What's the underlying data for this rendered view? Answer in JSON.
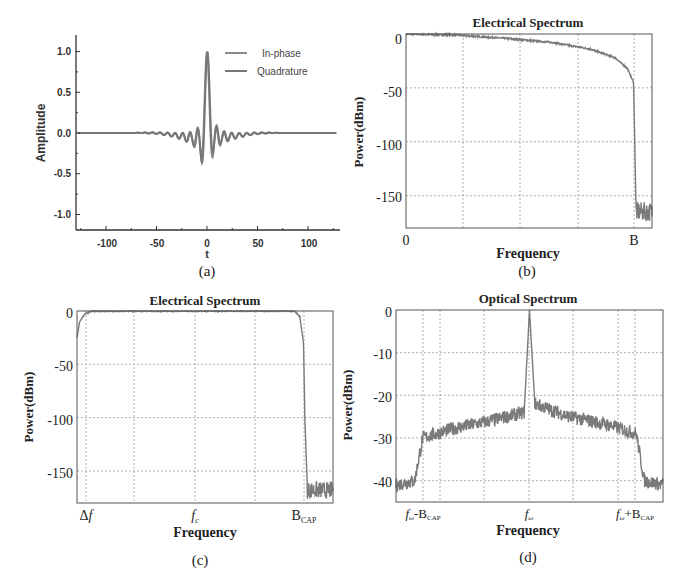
{
  "chart_data": [
    {
      "id": "a",
      "type": "line",
      "panel_label": "(a)",
      "title": "",
      "xlabel": "t",
      "ylabel": "Amplitude",
      "xlim": [
        -130,
        130
      ],
      "ylim": [
        -1.2,
        1.2
      ],
      "xticks": [
        "-100",
        "-50",
        "0",
        "50",
        "100"
      ],
      "xtick_values": [
        -100,
        -50,
        0,
        50,
        100
      ],
      "yticks": [
        "1.0",
        "0.5",
        "0.0",
        "-0.5",
        "-1.0"
      ],
      "ytick_values": [
        1.0,
        0.5,
        0.0,
        -0.5,
        -1.0
      ],
      "grid": false,
      "legend": {
        "position": "upper right",
        "entries": [
          "In-phase",
          "Quadrature"
        ]
      },
      "series": [
        {
          "name": "In-phase",
          "description": "SRRC pulse modulated by cosine carrier, peak 1.0 near t=-3 and t=3",
          "peak": 1.0,
          "min": -0.4
        },
        {
          "name": "Quadrature",
          "description": "SRRC pulse modulated by sine carrier, peak 1.0 at t=+3, trough -1.0 at t=-5",
          "peak": 1.0,
          "min": -1.0
        }
      ]
    },
    {
      "id": "b",
      "type": "line",
      "panel_label": "(b)",
      "title": "Electrical Spectrum",
      "xlabel": "Frequency",
      "ylabel": "Power(dBm)",
      "ylim": [
        -180,
        0
      ],
      "yticks": [
        "0",
        "-50",
        "-100",
        "-150"
      ],
      "ytick_values": [
        0,
        -50,
        -100,
        -150
      ],
      "xticks": [
        "0",
        "B"
      ],
      "grid": true,
      "series": [
        {
          "name": "spectrum",
          "x": [
            0,
            0.2,
            0.4,
            0.6,
            0.75,
            0.85,
            0.9,
            0.925,
            0.93,
            0.935,
            1.0
          ],
          "y": [
            0,
            -1,
            -4,
            -8,
            -14,
            -22,
            -32,
            -45,
            -100,
            -165,
            -165
          ]
        }
      ]
    },
    {
      "id": "c",
      "type": "line",
      "panel_label": "(c)",
      "title": "Electrical Spectrum",
      "xlabel": "Frequency",
      "ylabel": "Power(dBm)",
      "ylim": [
        -180,
        0
      ],
      "yticks": [
        "0",
        "-50",
        "-100",
        "-150"
      ],
      "ytick_values": [
        0,
        -50,
        -100,
        -150
      ],
      "xticks": [
        "Δf",
        "f_c",
        "B_CAP"
      ],
      "grid": true,
      "series": [
        {
          "name": "spectrum",
          "x": [
            0,
            0.01,
            0.03,
            0.06,
            0.85,
            0.87,
            0.885,
            0.89,
            0.9,
            1.0
          ],
          "y": [
            -25,
            -10,
            -3,
            0,
            0,
            -5,
            -30,
            -100,
            -168,
            -168
          ]
        }
      ]
    },
    {
      "id": "d",
      "type": "line",
      "panel_label": "(d)",
      "title": "Optical Spectrum",
      "xlabel": "Frequency",
      "ylabel": "Power(dBm)",
      "ylim": [
        -45,
        0
      ],
      "yticks": [
        "0",
        "-10",
        "-20",
        "-30",
        "-40"
      ],
      "ytick_values": [
        0,
        -10,
        -20,
        -30,
        -40
      ],
      "xticks": [
        "f_ω -B_CAP",
        "f_ω",
        "f_ω +B_CAP"
      ],
      "grid": true,
      "series": [
        {
          "name": "spectrum",
          "x": [
            0,
            0.07,
            0.1,
            0.2,
            0.35,
            0.48,
            0.5,
            0.52,
            0.65,
            0.8,
            0.9,
            0.93,
            1.0
          ],
          "y": [
            -41,
            -40,
            -30,
            -28,
            -26,
            -24,
            0,
            -22,
            -25,
            -27,
            -29,
            -40,
            -41
          ]
        }
      ]
    }
  ],
  "labels": {
    "a": {
      "panel": "(a)",
      "xlabel": "t",
      "ylabel": "Amplitude",
      "legend_1": "In-phase",
      "legend_2": "Quadrature",
      "xt": [
        "-100",
        "-50",
        "0",
        "50",
        "100"
      ],
      "yt": [
        "1.0",
        "0.5",
        "0.0",
        "-0.5",
        "-1.0"
      ]
    },
    "b": {
      "panel": "(b)",
      "title": "Electrical Spectrum",
      "xlabel": "Frequency",
      "ylabel": "Power(dBm)",
      "yt": [
        "0",
        "-50",
        "-100",
        "-150"
      ],
      "xt0": "0",
      "xtB": "B"
    },
    "c": {
      "panel": "(c)",
      "title": "Electrical Spectrum",
      "xlabel": "Frequency",
      "ylabel": "Power(dBm)",
      "yt": [
        "0",
        "-50",
        "-100",
        "-150"
      ],
      "xt_delta": "Δ",
      "xt_f": "f",
      "xt_fc_sub": "c",
      "xt_B": "B",
      "xt_B_sub": "CAP"
    },
    "d": {
      "panel": "(d)",
      "title": "Optical Spectrum",
      "xlabel": "Frequency",
      "ylabel": "Power(dBm)",
      "yt": [
        "0",
        "-10",
        "-20",
        "-30",
        "-40"
      ],
      "xt_f": "f",
      "xt_w": "ω",
      "xt_minus": "-B",
      "xt_plus": "+B",
      "xt_sub": "CAP"
    }
  },
  "colors": {
    "trace": "#7a7a7a",
    "trace_dark": "#6e6e6e",
    "axis": "#333333",
    "grid": "#9a9a9a",
    "text": "#222222"
  }
}
